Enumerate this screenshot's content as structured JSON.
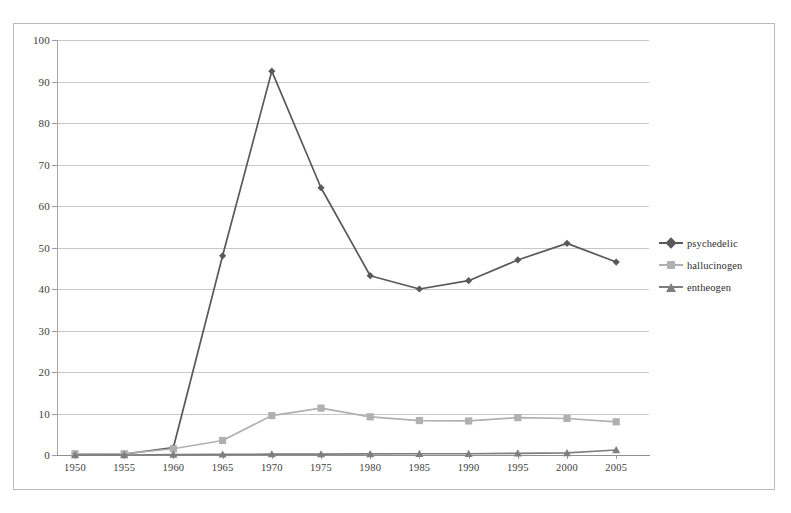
{
  "chart_data": {
    "type": "line",
    "title": "",
    "xlabel": "",
    "ylabel": "",
    "categories": [
      "1950",
      "1955",
      "1960",
      "1965",
      "1970",
      "1975",
      "1980",
      "1985",
      "1990",
      "1995",
      "2000",
      "2005"
    ],
    "ylim": [
      0,
      100
    ],
    "yticks": [
      0,
      10,
      20,
      30,
      40,
      50,
      60,
      70,
      80,
      90,
      100
    ],
    "grid": true,
    "legend_position": "right",
    "series": [
      {
        "name": "psychedelic",
        "marker": "diamond",
        "color": "#595959",
        "values": [
          0.3,
          0.2,
          1.8,
          48.0,
          92.5,
          64.4,
          43.2,
          40.0,
          42.0,
          47.0,
          51.0,
          46.5
        ]
      },
      {
        "name": "hallucinogen",
        "marker": "square",
        "color": "#b0b0b0",
        "values": [
          0.3,
          0.3,
          1.5,
          3.5,
          9.5,
          11.3,
          9.2,
          8.3,
          8.2,
          9.0,
          8.8,
          8.0
        ]
      },
      {
        "name": "entheogen",
        "marker": "triangle",
        "color": "#7e7e7e",
        "values": [
          0.0,
          0.0,
          0.1,
          0.15,
          0.2,
          0.2,
          0.25,
          0.3,
          0.3,
          0.4,
          0.5,
          1.2
        ]
      }
    ]
  },
  "legend": {
    "items": [
      {
        "label": "psychedelic"
      },
      {
        "label": "hallucinogen"
      },
      {
        "label": "entheogen"
      }
    ]
  },
  "colors": {
    "psychedelic": "#595959",
    "hallucinogen": "#b0b0b0",
    "entheogen": "#7e7e7e",
    "gridline": "#c8c8c8",
    "frame": "#b9b9b9",
    "axis": "#9a9a9a",
    "text": "#3d3d3d",
    "background": "#ffffff"
  }
}
